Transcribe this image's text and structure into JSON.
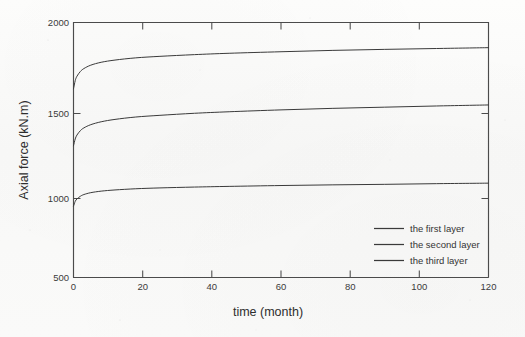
{
  "figure": {
    "background_color": "#fbfbfa",
    "line_color": "#3a3a3a",
    "axis_color": "#4b4b4b"
  },
  "chart_data": {
    "type": "line",
    "title": "",
    "xlabel": "time (month)",
    "ylabel": "Axial force (kN.m)",
    "xlim": [
      0,
      120
    ],
    "ylim": [
      500,
      2000
    ],
    "xticks": [
      0,
      20,
      40,
      60,
      80,
      100,
      120
    ],
    "xtick_labels": [
      "0",
      "20",
      "40",
      "60",
      "80",
      "100",
      "120"
    ],
    "yticks": [
      500,
      1000,
      1500,
      2000
    ],
    "ytick_labels": [
      "500",
      "1000",
      "1500",
      "2000"
    ],
    "grid": false,
    "legend_position": "lower right",
    "series": [
      {
        "name": "the first layer",
        "color": "#3a3a3a",
        "x": [
          0,
          0.5,
          1,
          2,
          3,
          5,
          8,
          12,
          18,
          25,
          35,
          45,
          60,
          75,
          90,
          105,
          120
        ],
        "y": [
          920,
          948,
          962,
          978,
          988,
          999,
          1008,
          1015,
          1022,
          1027,
          1032,
          1036,
          1041,
          1045,
          1048,
          1052,
          1055
        ]
      },
      {
        "name": "the second layer",
        "color": "#3a3a3a",
        "x": [
          0,
          0.5,
          1,
          2,
          3,
          5,
          8,
          12,
          18,
          25,
          35,
          45,
          60,
          75,
          90,
          105,
          120
        ],
        "y": [
          1275,
          1315,
          1338,
          1364,
          1380,
          1399,
          1416,
          1430,
          1444,
          1454,
          1466,
          1475,
          1486,
          1495,
          1502,
          1509,
          1515
        ]
      },
      {
        "name": "the third layer",
        "color": "#3a3a3a",
        "x": [
          0,
          0.5,
          1,
          2,
          3,
          5,
          8,
          12,
          18,
          25,
          35,
          45,
          60,
          75,
          90,
          105,
          120
        ],
        "y": [
          1610,
          1658,
          1684,
          1712,
          1729,
          1749,
          1766,
          1779,
          1792,
          1801,
          1811,
          1819,
          1828,
          1836,
          1842,
          1847,
          1852
        ]
      }
    ],
    "legend_entries": [
      "the first layer",
      "the second layer",
      "the third layer"
    ]
  }
}
